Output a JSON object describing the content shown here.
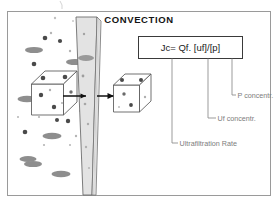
{
  "figure": {
    "title": "CONVECTION",
    "border_color": "#9a9a9a",
    "background": "#ffffff"
  },
  "formula": {
    "text": "Jc= Qf. [uf]/[p]",
    "box_border_color": "#3a3a3a"
  },
  "annotations": [
    {
      "id": "p-concentration",
      "label": "P concentr.",
      "leader_from_x": 232,
      "leader_to_y": 95
    },
    {
      "id": "uf-concentration",
      "label": "Uf concentr.",
      "leader_from_x": 208,
      "leader_to_y": 118
    },
    {
      "id": "ultrafiltration-rate",
      "label": "Ultrafiltration Rate",
      "leader_from_x": 172,
      "leader_to_y": 143
    }
  ],
  "membrane": {
    "name": "membrane-plane",
    "face_color": "#e3e3e3",
    "edge_color": "#6e6e6e",
    "side_color": "#f2f2f2"
  },
  "cubes": [
    {
      "id": "solute-rich-cube",
      "side": "left",
      "particle_count": 7,
      "note": "high concentration"
    },
    {
      "id": "solute-poor-cube",
      "side": "right",
      "particle_count": 5,
      "note": "filtrate side"
    }
  ],
  "arrows": [
    {
      "id": "flow-arrow-into-membrane",
      "direction": "right"
    },
    {
      "id": "flow-arrow-out-of-membrane",
      "direction": "right"
    }
  ],
  "particles": {
    "small_dot_color": "#4a4a4a",
    "large_ellipse_color": "#8e8e8e",
    "tiny_dot_color": "#b5b5b5"
  },
  "colors": {
    "ink": "#1a1a1a",
    "gray_text": "#7d7d7d",
    "line": "#5c5c5c"
  }
}
